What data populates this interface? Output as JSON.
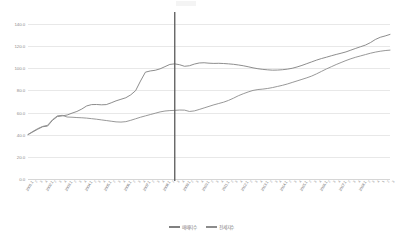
{
  "chart_data": {
    "type": "line",
    "title": "",
    "xlabel": "",
    "ylabel": "",
    "ylim": [
      0,
      140
    ],
    "yticks": [
      "0.0",
      "20.0",
      "40.0",
      "60.0",
      "80.0",
      "100.0",
      "120.0",
      "140.0"
    ],
    "grid": true,
    "legend_position": "bottom",
    "annotations": [
      {
        "type": "vertical-line",
        "label": "",
        "x_category": "2008.3",
        "color": "#595959"
      }
    ],
    "categories": [
      "2001.1",
      "2001.2",
      "2001.3",
      "2001.4",
      "2002.1",
      "2002.2",
      "2002.3",
      "2002.4",
      "2003.1",
      "2003.2",
      "2003.3",
      "2003.4",
      "2004.1",
      "2004.2",
      "2004.3",
      "2004.4",
      "2005.1",
      "2005.2",
      "2005.3",
      "2005.4",
      "2006.1",
      "2006.2",
      "2006.3",
      "2006.4",
      "2007.1",
      "2007.2",
      "2007.3",
      "2007.4",
      "2008.1",
      "2008.2",
      "2008.3",
      "2008.4",
      "2009.1",
      "2009.2",
      "2009.3",
      "2009.4",
      "2010.1",
      "2010.2",
      "2010.3",
      "2010.4",
      "2011.1",
      "2011.2",
      "2011.3",
      "2011.4",
      "2012.1",
      "2012.2",
      "2012.3",
      "2012.4",
      "2013.1",
      "2013.2",
      "2013.3",
      "2013.4",
      "2014.1",
      "2014.2",
      "2014.3",
      "2014.4",
      "2015.1",
      "2015.2",
      "2015.3",
      "2015.4",
      "2016.1",
      "2016.2",
      "2016.3",
      "2016.4",
      "2017.1",
      "2017.2",
      "2017.3",
      "2017.4",
      "2018.1",
      "2018.2",
      "2018.3",
      "2018.4",
      "2019.1",
      "2019.2",
      "2019.3"
    ],
    "major_tick_labels": [
      "2001.1",
      "2002.1",
      "2003.1",
      "2004.1",
      "2005.1",
      "2006.1",
      "2007.1",
      "2008.1",
      "2009.1",
      "2010.1",
      "2011.1",
      "2012.1",
      "2013.1",
      "2014.1",
      "2015.1",
      "2016.1",
      "2017.1",
      "2018.1"
    ],
    "series": [
      {
        "name": "매매지수",
        "color": "#808080",
        "values": [
          40.2,
          42.5,
          45.0,
          47.2,
          47.8,
          53.0,
          56.4,
          57.0,
          57.8,
          59.5,
          61.0,
          63.2,
          66.0,
          67.2,
          67.3,
          67.0,
          67.2,
          68.8,
          70.6,
          72.0,
          73.4,
          76.0,
          79.8,
          88.5,
          96.5,
          97.6,
          98.2,
          99.5,
          101.5,
          103.5,
          104.0,
          103.2,
          101.8,
          102.3,
          103.8,
          104.8,
          105.0,
          104.6,
          104.4,
          104.5,
          104.3,
          104.0,
          103.6,
          103.0,
          102.3,
          101.4,
          100.4,
          99.6,
          99.0,
          98.6,
          98.3,
          98.4,
          98.7,
          99.2,
          100.0,
          101.2,
          102.6,
          104.2,
          105.8,
          107.4,
          108.8,
          110.0,
          111.3,
          112.5,
          113.6,
          114.8,
          116.4,
          118.0,
          119.5,
          121.0,
          123.2,
          126.0,
          128.0,
          129.2,
          130.6
        ]
      },
      {
        "name": "전세지수",
        "color": "#8c8c8c",
        "values": [
          40.0,
          43.0,
          45.5,
          47.5,
          48.5,
          53.5,
          57.0,
          57.5,
          56.0,
          55.8,
          55.5,
          55.3,
          55.0,
          54.5,
          54.0,
          53.4,
          52.8,
          52.2,
          51.6,
          51.4,
          51.8,
          53.0,
          54.4,
          55.8,
          57.0,
          58.2,
          59.4,
          60.6,
          61.4,
          61.8,
          62.0,
          62.3,
          62.2,
          61.0,
          61.5,
          62.8,
          64.2,
          65.6,
          67.0,
          68.2,
          69.4,
          71.0,
          73.0,
          75.2,
          77.0,
          78.6,
          80.0,
          80.8,
          81.2,
          81.8,
          82.6,
          83.6,
          84.6,
          85.8,
          87.2,
          88.6,
          90.0,
          91.4,
          93.0,
          95.0,
          97.2,
          99.4,
          101.4,
          103.4,
          105.2,
          107.0,
          108.6,
          110.0,
          111.2,
          112.4,
          113.6,
          114.6,
          115.4,
          116.0,
          116.4
        ]
      }
    ]
  },
  "legend": {
    "items": [
      {
        "label": "매매지수",
        "color": "#808080"
      },
      {
        "label": "전세지수",
        "color": "#8c8c8c"
      }
    ]
  }
}
